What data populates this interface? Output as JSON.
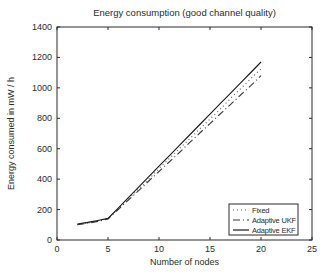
{
  "figure": {
    "title": "Energy consumption (good channel quality)",
    "xlabel": "Number of nodes",
    "ylabel": "Energy consumed in mW / h"
  },
  "chart_data": {
    "type": "line",
    "title": "Energy consumption (good channel quality)",
    "xlabel": "Number of nodes",
    "ylabel": "Energy consumed in mW / h",
    "xlim": [
      0,
      25
    ],
    "ylim": [
      0,
      1400
    ],
    "x_ticks": [
      0,
      5,
      10,
      15,
      20,
      25
    ],
    "y_ticks": [
      0,
      200,
      400,
      600,
      800,
      1000,
      1200,
      1400
    ],
    "grid": false,
    "legend_position": "lower right",
    "x": [
      2,
      3,
      4,
      5,
      6,
      7,
      8,
      9,
      10,
      11,
      12,
      13,
      14,
      15,
      16,
      17,
      18,
      19,
      20
    ],
    "series": [
      {
        "name": "Fixed",
        "style": "dotted",
        "color": "#5a5a5a",
        "values": [
          100,
          112,
          125,
          140,
          205,
          270,
          335,
          400,
          470,
          535,
          600,
          665,
          730,
          795,
          860,
          930,
          995,
          1060,
          1125
        ]
      },
      {
        "name": "Adaptive UKF",
        "style": "dashdot",
        "color": "#3a3a3a",
        "values": [
          100,
          110,
          122,
          138,
          200,
          263,
          325,
          388,
          450,
          513,
          575,
          640,
          703,
          765,
          828,
          890,
          953,
          1015,
          1080
        ]
      },
      {
        "name": "Adaptive EKF",
        "style": "solid",
        "color": "#1a1a1a",
        "values": [
          105,
          116,
          128,
          142,
          210,
          278,
          347,
          416,
          485,
          553,
          622,
          690,
          759,
          827,
          896,
          964,
          1033,
          1101,
          1170
        ]
      }
    ]
  }
}
